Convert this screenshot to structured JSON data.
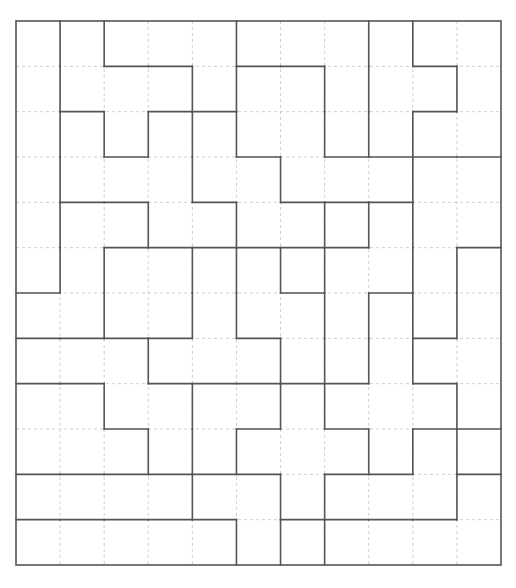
{
  "puzzle": {
    "type": "region-partition-grid",
    "cols": 11,
    "rows": 12,
    "colors": {
      "wall": "#555555",
      "grid": "#cfcfcf",
      "background": "#ffffff"
    },
    "horizontal_walls": {
      "1": [
        2,
        3,
        5,
        6,
        9
      ],
      "2": [
        1,
        3,
        4,
        9
      ],
      "3": [
        2,
        5,
        7,
        8,
        9,
        10
      ],
      "4": [
        1,
        2,
        4,
        6,
        7,
        8
      ],
      "5": [
        2,
        3,
        4,
        5,
        6,
        7,
        10
      ],
      "6": [
        0,
        6,
        8
      ],
      "7": [
        0,
        1,
        2,
        3,
        5,
        9
      ],
      "8": [
        0,
        1,
        3,
        4,
        5,
        6,
        7,
        9
      ],
      "9": [
        2,
        5,
        7,
        9,
        10
      ],
      "10": [
        0,
        1,
        2,
        3,
        4,
        5,
        7,
        8,
        10
      ],
      "11": [
        0,
        1,
        2,
        3,
        4,
        6,
        7,
        8,
        9
      ]
    },
    "vertical_walls": {
      "1": [
        0,
        1,
        2,
        3,
        4,
        5
      ],
      "2": [
        0,
        2,
        5,
        6,
        8
      ],
      "3": [
        2,
        4,
        7,
        9
      ],
      "4": [
        1,
        2,
        3,
        5,
        6,
        8,
        9,
        10
      ],
      "5": [
        0,
        1,
        2,
        4,
        5,
        6,
        9,
        11
      ],
      "6": [
        3,
        5,
        7,
        8,
        10,
        11
      ],
      "7": [
        1,
        2,
        4,
        5,
        6,
        7,
        8,
        10,
        11
      ],
      "8": [
        0,
        1,
        2,
        4,
        6,
        7,
        9
      ],
      "9": [
        0,
        2,
        3,
        4,
        5,
        6,
        7,
        9
      ],
      "10": [
        1,
        5,
        6,
        8,
        9,
        10
      ]
    }
  }
}
